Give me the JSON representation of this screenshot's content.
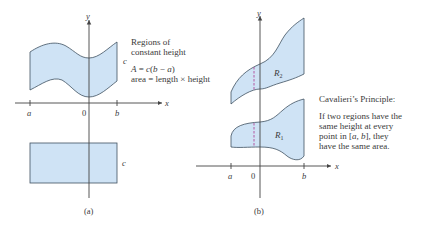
{
  "panel_a": {
    "caption": "(a)",
    "axis_labels": {
      "x": "x",
      "y": "y",
      "origin": "0",
      "a": "a",
      "b": "b"
    },
    "height_label_top": "c",
    "height_label_bottom": "c",
    "annotation": {
      "line1": "Regions of",
      "line2": "constant height",
      "formula": "A = c(b − a)",
      "formula_parts": {
        "A": "A",
        "eq": " = ",
        "c": "c",
        "open": "(",
        "b": "b",
        "minus": " − ",
        "a": "a",
        "close": ")"
      },
      "area_text": "area = length × height"
    }
  },
  "panel_b": {
    "caption": "(b)",
    "axis_labels": {
      "x": "x",
      "y": "y",
      "origin": "0",
      "a": "a",
      "b": "b"
    },
    "region_upper": {
      "letter": "R",
      "sub": "2"
    },
    "region_lower": {
      "letter": "R",
      "sub": "1"
    },
    "annotation": {
      "title": "Cavalieri’s Principle:",
      "line1": "If two regions have the",
      "line2": "same height at every",
      "line3_pre": "point in [",
      "line3_a": "a",
      "line3_mid": ", ",
      "line3_b": "b",
      "line3_post": "], they",
      "line4": "have the same area."
    }
  },
  "colors": {
    "region_fill": "#cfe3f5",
    "outline": "#3f5060",
    "dashed_segment": "#b04a9a",
    "text": "#3a3a3a"
  }
}
